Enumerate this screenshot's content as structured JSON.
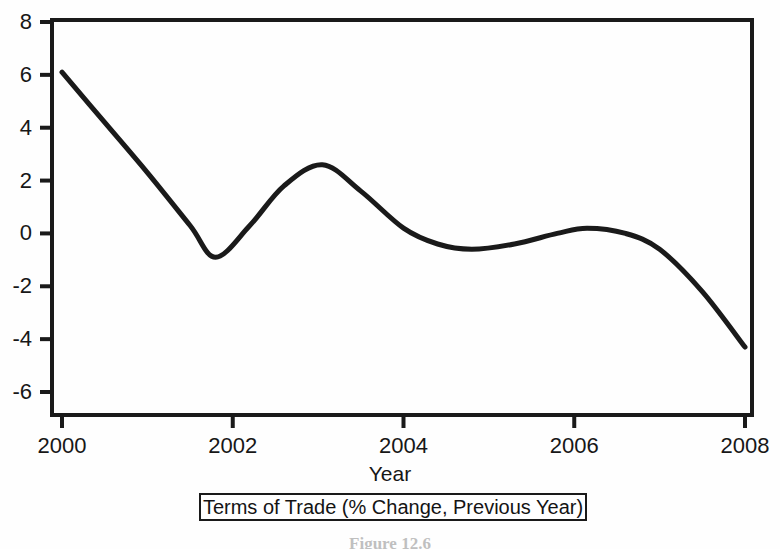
{
  "figure": {
    "caption": "Figure 12.6",
    "background_color": "#fefefe",
    "line_color": "#1a1a1a",
    "axis_color": "#1a1a1a"
  },
  "legend": {
    "label": "Terms of Trade (% Change, Previous Year)"
  },
  "chart_data": {
    "type": "line",
    "title": "",
    "subtitle": "",
    "xlabel": "Year",
    "ylabel": "",
    "xlim": [
      2000,
      2008
    ],
    "ylim": [
      -6,
      8
    ],
    "xticks": [
      2000,
      2002,
      2004,
      2006,
      2008
    ],
    "xtick_labels": [
      "2000",
      "2002",
      "2004",
      "2006",
      "2008"
    ],
    "yticks": [
      -6,
      -4,
      -2,
      0,
      2,
      4,
      6,
      8
    ],
    "ytick_labels": [
      "-6",
      "-4",
      "-2",
      "0",
      "2",
      "4",
      "6",
      "8"
    ],
    "grid": false,
    "legend_position": "below-axis",
    "series": [
      {
        "name": "Terms of Trade (% Change, Previous Year)",
        "color": "#1a1a1a",
        "line_width": 5,
        "smoothed": true,
        "x": [
          2000.0,
          2000.5,
          2001.0,
          2001.5,
          2001.8,
          2002.2,
          2002.6,
          2003.05,
          2003.5,
          2004.0,
          2004.4,
          2004.8,
          2005.3,
          2005.8,
          2006.15,
          2006.6,
          2007.0,
          2007.5,
          2008.0
        ],
        "y": [
          6.1,
          4.2,
          2.3,
          0.3,
          -0.9,
          0.3,
          1.8,
          2.6,
          1.6,
          0.2,
          -0.4,
          -0.6,
          -0.4,
          0.0,
          0.2,
          0.0,
          -0.6,
          -2.2,
          -4.3
        ]
      }
    ],
    "annotations": [
      {
        "label": "start",
        "x": 2000.0,
        "y": 6.1
      },
      {
        "label": "trough-2001",
        "x": 2001.8,
        "y": -0.9
      },
      {
        "label": "peak-2003",
        "x": 2003.05,
        "y": 2.6
      },
      {
        "label": "dip-2004",
        "x": 2004.8,
        "y": -0.6
      },
      {
        "label": "plateau-2006",
        "x": 2006.15,
        "y": 0.2
      },
      {
        "label": "end-2008",
        "x": 2008.0,
        "y": -4.3
      }
    ]
  }
}
